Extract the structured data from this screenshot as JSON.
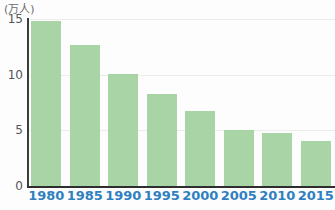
{
  "chart_data": {
    "type": "bar",
    "title": "",
    "subtitle": "",
    "xlabel": "",
    "ylabel": "万人",
    "unit_label": "(万人)",
    "categories": [
      "1980",
      "1985",
      "1990",
      "1995",
      "2000",
      "2005",
      "2010",
      "2015"
    ],
    "values": [
      14.8,
      12.7,
      10.1,
      8.3,
      6.7,
      5.0,
      4.8,
      4.0
    ],
    "ylim": [
      0,
      15
    ],
    "yticks": [
      0,
      5,
      10,
      15
    ],
    "ytick_labels": [
      "0",
      "5",
      "10",
      "15"
    ],
    "grid": true,
    "grid_axis": "y",
    "legend": false,
    "legend_position": "none",
    "bar_color": "#a9d5a6",
    "axis_color": "#2e2e2e",
    "gridline_color": "#ececec",
    "xlabel_color": "#2f7fc1",
    "ylabel_color": "#555555",
    "series": [
      {
        "name": "",
        "values": [
          14.8,
          12.7,
          10.1,
          8.3,
          6.7,
          5.0,
          4.8,
          4.0
        ]
      }
    ]
  },
  "source_note": ""
}
